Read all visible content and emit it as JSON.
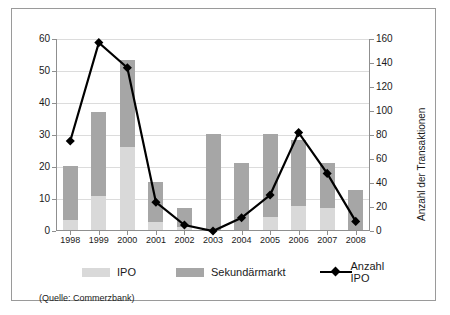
{
  "chart_data": {
    "type": "bar",
    "title": "",
    "subtitle": "",
    "xlabel": "",
    "ylabel": "",
    "ylabel_right": "Anzahl der Transaktionen",
    "grid": true,
    "legend_position": "bottom",
    "categories": [
      "1998",
      "1999",
      "2000",
      "2001",
      "2002",
      "2003",
      "2004",
      "2005",
      "2006",
      "2007",
      "2008"
    ],
    "ylim": [
      0,
      60
    ],
    "yticks": [
      0,
      10,
      20,
      30,
      40,
      50,
      60
    ],
    "ylim_right": [
      0,
      160
    ],
    "yticks_right": [
      0,
      20,
      40,
      60,
      80,
      100,
      120,
      140,
      160
    ],
    "series": [
      {
        "name": "IPO",
        "type": "bar",
        "stack": "total",
        "axis": "left",
        "color": "#d9d9d9",
        "values": [
          3,
          10.5,
          26,
          2.5,
          1,
          0,
          0,
          4,
          7.5,
          7,
          0
        ]
      },
      {
        "name": "Sekundärmarkt",
        "type": "bar",
        "stack": "total",
        "axis": "left",
        "color": "#a6a6a6",
        "values": [
          17,
          26.5,
          27,
          12.5,
          6,
          30,
          21,
          26,
          20.5,
          14,
          12.5
        ]
      },
      {
        "name": "Anzahl IPO",
        "type": "line",
        "axis": "right",
        "color": "#000000",
        "marker": "diamond",
        "values": [
          75,
          157,
          136,
          24,
          5,
          0,
          11,
          30,
          82,
          48,
          8
        ]
      }
    ],
    "stacked_totals": [
      20,
      37,
      53,
      15,
      7,
      30,
      21,
      30,
      28,
      21,
      12.5
    ]
  },
  "legend": {
    "items": [
      {
        "label": "IPO",
        "swatch": "ipo-swatch"
      },
      {
        "label": "Sekundärmarkt",
        "swatch": "sekundaermarkt-swatch"
      },
      {
        "label": "Anzahl IPO",
        "swatch": "line-marker-swatch"
      }
    ]
  },
  "source": {
    "text": "(Quelle: Commerzbank)"
  }
}
